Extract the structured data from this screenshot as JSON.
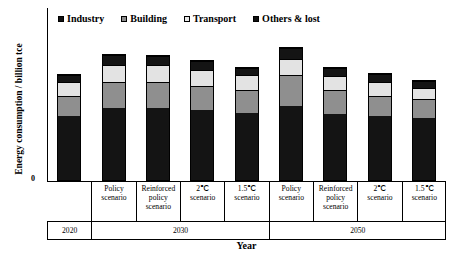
{
  "chart_data": {
    "type": "bar",
    "subtype": "stacked",
    "title": "",
    "xlabel": "Year",
    "ylabel": "Energy consumption / billion tce",
    "ylim": [
      0,
      7
    ],
    "ytick_labels": [
      "0"
    ],
    "grid": false,
    "legend_position": "top",
    "legend": [
      "Industry",
      "Building",
      "Transport",
      "Others & lost"
    ],
    "group_labels": [
      "2020",
      "2030",
      "2050"
    ],
    "categories": [
      "2020",
      "Policy scenario",
      "Reinforced policy scenario",
      "2℃ scenario",
      "1.5℃ scenario",
      "Policy scenario",
      "Reinforced policy scenario",
      "2℃ scenario",
      "1.5℃ scenario"
    ],
    "series": [
      {
        "name": "Industry",
        "color": "#141414",
        "values": [
          2.62,
          2.97,
          2.96,
          2.9,
          2.78,
          3.05,
          2.72,
          2.62,
          2.56
        ]
      },
      {
        "name": "Building",
        "color": "#8f8f8f",
        "values": [
          0.86,
          1.08,
          1.05,
          0.97,
          0.93,
          1.28,
          0.97,
          0.86,
          0.8
        ]
      },
      {
        "name": "Transport",
        "color": "#e3e3e3",
        "values": [
          0.56,
          0.69,
          0.72,
          0.67,
          0.6,
          0.66,
          0.6,
          0.58,
          0.44
        ]
      },
      {
        "name": "Others & lost",
        "color": "#141414",
        "values": [
          0.28,
          0.4,
          0.35,
          0.34,
          0.31,
          0.42,
          0.33,
          0.32,
          0.3
        ]
      }
    ],
    "totals": [
      4.32,
      5.14,
      5.08,
      4.88,
      4.62,
      5.41,
      4.62,
      4.38,
      4.1
    ]
  },
  "axes": {
    "ylabel": "Energy consumption / billion tce",
    "ytick_zero": "0",
    "xlabel": "Year"
  },
  "legend": {
    "items": [
      {
        "label": "Industry",
        "swatch": "industry-swatch"
      },
      {
        "label": "Building",
        "swatch": "building-swatch"
      },
      {
        "label": "Transport",
        "swatch": "transport-swatch"
      },
      {
        "label": "Others & lost",
        "swatch": "others-swatch"
      }
    ]
  },
  "xaxis": {
    "scenarios": [
      "",
      "Policy\nscenario",
      "Reinforced\npolicy\nscenario",
      "2℃\nscenario",
      "1.5℃\nscenario",
      "Policy\nscenario",
      "Reinforced\npolicy\nscenario",
      "2℃\nscenario",
      "1.5℃\nscenario"
    ],
    "years": [
      "2020",
      "2030",
      "2050"
    ]
  }
}
